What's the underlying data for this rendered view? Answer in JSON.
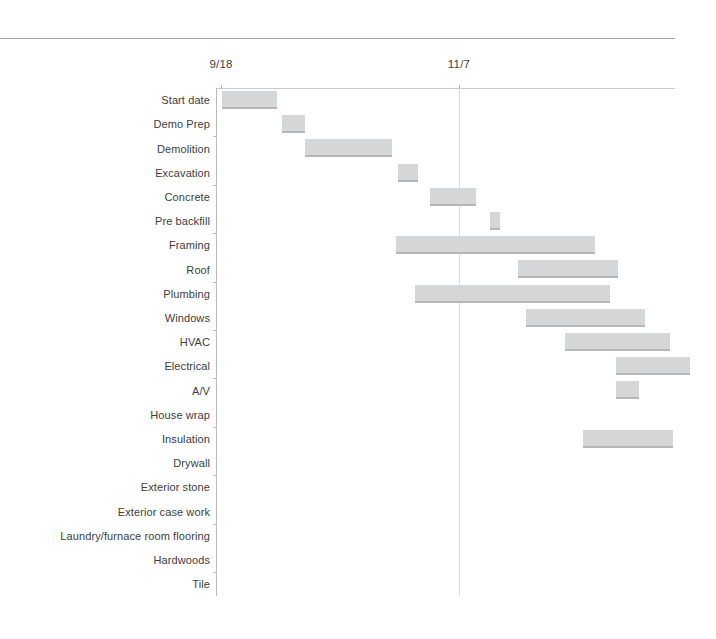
{
  "chart_data": {
    "type": "bar",
    "subtype": "gantt",
    "title": "",
    "xlabel": "",
    "ylabel": "",
    "grid": true,
    "legend": false,
    "orientation": "horizontal",
    "axis_position": "top",
    "x_tick_labels": [
      "9/18",
      "11/7"
    ],
    "x_tick_positions_px": [
      221,
      459
    ],
    "axis_pixel_range": [
      216,
      675
    ],
    "bar_color": "#d5d6d7",
    "bar_edge_color": "#b6b7b9",
    "gridline_color": "#d9dbdd",
    "categories": [
      "Start date",
      "Demo Prep",
      "Demolition",
      "Excavation",
      "Concrete",
      "Pre backfill",
      "Framing",
      "Roof",
      "Plumbing",
      "Windows",
      "HVAC",
      "Electrical",
      "A/V",
      "House wrap",
      "Insulation",
      "Drywall",
      "Exterior stone",
      "Exterior case work",
      "Laundry/furnace room flooring",
      "Hardwoods",
      "Tile"
    ],
    "bars": [
      {
        "task": "Start date",
        "start_px": 222,
        "end_px": 277
      },
      {
        "task": "Demo Prep",
        "start_px": 282,
        "end_px": 305
      },
      {
        "task": "Demolition",
        "start_px": 305,
        "end_px": 392
      },
      {
        "task": "Excavation",
        "start_px": 398,
        "end_px": 418
      },
      {
        "task": "Concrete",
        "start_px": 430,
        "end_px": 476
      },
      {
        "task": "Pre backfill",
        "start_px": 490,
        "end_px": 500
      },
      {
        "task": "Framing",
        "start_px": 396,
        "end_px": 595
      },
      {
        "task": "Roof",
        "start_px": 518,
        "end_px": 618
      },
      {
        "task": "Plumbing",
        "start_px": 415,
        "end_px": 610
      },
      {
        "task": "Windows",
        "start_px": 526,
        "end_px": 645
      },
      {
        "task": "HVAC",
        "start_px": 565,
        "end_px": 670
      },
      {
        "task": "Electrical",
        "start_px": 616,
        "end_px": 690
      },
      {
        "task": "A/V",
        "start_px": 616,
        "end_px": 639
      },
      {
        "task": "House wrap",
        "start_px": null,
        "end_px": null
      },
      {
        "task": "Insulation",
        "start_px": 583,
        "end_px": 673
      },
      {
        "task": "Drywall",
        "start_px": null,
        "end_px": null
      },
      {
        "task": "Exterior stone",
        "start_px": null,
        "end_px": null
      },
      {
        "task": "Exterior case work",
        "start_px": null,
        "end_px": null
      },
      {
        "task": "Laundry/furnace room flooring",
        "start_px": null,
        "end_px": null
      },
      {
        "task": "Hardwoods",
        "start_px": null,
        "end_px": null
      },
      {
        "task": "Tile",
        "start_px": null,
        "end_px": null
      }
    ]
  }
}
